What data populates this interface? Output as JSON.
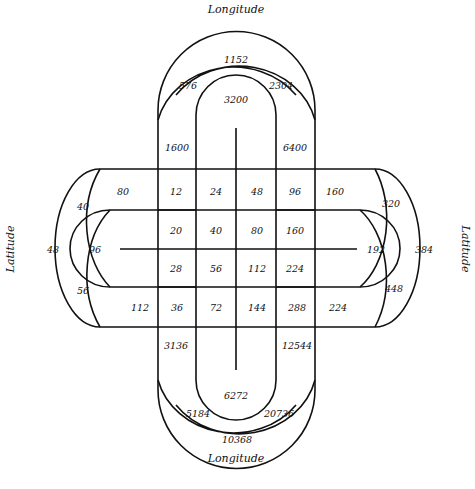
{
  "labels": {
    "top": "Longitude",
    "bottom": "Longitude",
    "left": "Latitude",
    "right": "Latitude"
  },
  "grid": {
    "row1": [
      "80",
      "12",
      "24",
      "48",
      "96",
      "160"
    ],
    "row2": [
      "20",
      "40",
      "80",
      "160"
    ],
    "row3": [
      "28",
      "56",
      "112",
      "224"
    ],
    "row4": [
      "112",
      "36",
      "72",
      "144",
      "288",
      "224"
    ]
  },
  "top": {
    "a": "1152",
    "b": "576",
    "c": "2304",
    "d": "3200",
    "e": "1600",
    "f": "6400"
  },
  "bottom": {
    "a": "3136",
    "b": "12544",
    "c": "6272",
    "d": "5184",
    "e": "20736",
    "f": "10368"
  },
  "left": {
    "a": "40",
    "b": "48",
    "c": "96",
    "d": "56"
  },
  "right": {
    "a": "320",
    "b": "192",
    "c": "384",
    "d": "448"
  }
}
